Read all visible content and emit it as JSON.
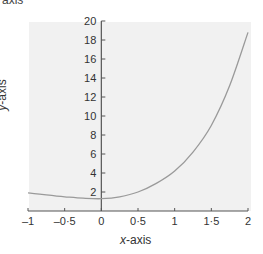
{
  "chart_data": {
    "type": "line",
    "title": "",
    "top_fragment": "axis",
    "xlabel_var": "x",
    "xlabel_rest": "-axis",
    "ylabel_var": "y",
    "ylabel_rest": "-axis",
    "xlim": [
      -1,
      2
    ],
    "ylim": [
      0,
      20
    ],
    "x_ticks": [
      "–1",
      "–0·5",
      "0",
      "0·5",
      "1",
      "1·5",
      "2"
    ],
    "y_ticks": [
      "2",
      "4",
      "6",
      "8",
      "10",
      "12",
      "14",
      "16",
      "18",
      "20"
    ],
    "grid": false,
    "series": [
      {
        "name": "curve",
        "x": [
          -1,
          -0.75,
          -0.5,
          -0.25,
          0,
          0.25,
          0.5,
          0.75,
          1,
          1.25,
          1.5,
          1.75,
          2
        ],
        "y": [
          1.9,
          1.7,
          1.5,
          1.35,
          1.3,
          1.5,
          2.0,
          2.9,
          4.2,
          6.2,
          9.0,
          13.2,
          18.8
        ]
      }
    ],
    "colors": {
      "background": "#f1f1f1",
      "axis": "#555555",
      "curve": "#9a9a9a"
    }
  }
}
